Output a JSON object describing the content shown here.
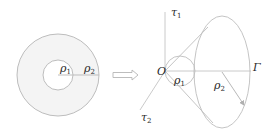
{
  "diagram": {
    "left_figure": {
      "name": "annulus",
      "center": [
        58,
        75
      ],
      "outer_radius": 41,
      "inner_radius": 15,
      "fill": "#f4f4f4",
      "stroke": "#b8b8b8",
      "labels": {
        "rho1": {
          "base": "ρ",
          "sub": "1"
        },
        "rho2": {
          "base": "ρ",
          "sub": "2"
        }
      }
    },
    "transform_arrow": {
      "from": [
        113,
        75
      ],
      "to": [
        138,
        75
      ],
      "style": "hollow double arrow"
    },
    "right_figure": {
      "name": "cone",
      "origin_label": "O",
      "axes": {
        "tau1": {
          "base": "τ",
          "sub": "1"
        },
        "tau2": {
          "base": "τ",
          "sub": "2"
        },
        "gamma": {
          "label": "Γ"
        }
      },
      "small_circle": {
        "center": [
          180,
          71
        ],
        "radius": 15
      },
      "ellipse": {
        "center": [
          222,
          72
        ],
        "rx": 28,
        "ry": 56
      },
      "labels": {
        "rho1": {
          "base": "ρ",
          "sub": "1"
        },
        "rho2": {
          "base": "ρ",
          "sub": "2"
        }
      },
      "stroke": "#b8b8b8"
    }
  }
}
